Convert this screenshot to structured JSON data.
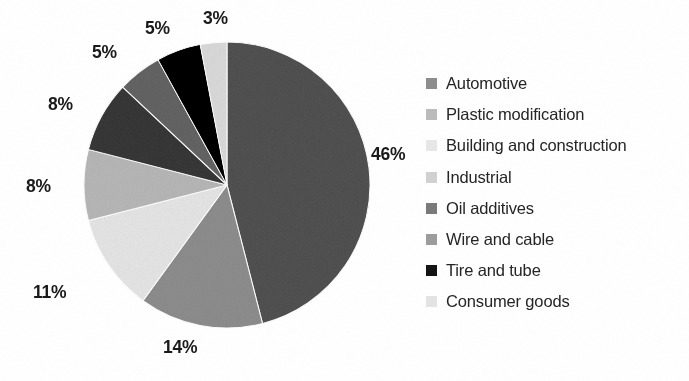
{
  "chart_data": {
    "type": "pie",
    "title": "",
    "subtitle": "",
    "xlabel": "",
    "ylabel": "",
    "grid": false,
    "legend_position": "right",
    "start_angle_deg": 0,
    "direction": "clockwise",
    "units": "percent",
    "total": 100,
    "categories": [
      "Automotive",
      "Plastic modification",
      "Building and construction",
      "Industrial",
      "Oil additives",
      "Wire and cable",
      "Tire and tube",
      "Consumer goods"
    ],
    "values": [
      46,
      14,
      11,
      8,
      8,
      5,
      5,
      3
    ],
    "data_labels": [
      "46%",
      "14%",
      "11%",
      "8%",
      "8%",
      "5%",
      "5%",
      "3%"
    ],
    "slice_colors": [
      "#8e8e8e",
      "#bdbdbd",
      "#f2f2f2",
      "#d8d8d8",
      "#757575",
      "#9e9e9e",
      "#111111",
      "#ececec"
    ],
    "slices": [
      {
        "label": "Automotive",
        "value": 46,
        "data_label": "46%",
        "color": "#8e8e8e"
      },
      {
        "label": "Plastic modification",
        "value": 14,
        "data_label": "14%",
        "color": "#bdbdbd"
      },
      {
        "label": "Building and construction",
        "value": 11,
        "data_label": "11%",
        "color": "#f2f2f2"
      },
      {
        "label": "Industrial",
        "value": 8,
        "data_label": "8%",
        "color": "#d8d8d8"
      },
      {
        "label": "Oil additives",
        "value": 8,
        "data_label": "8%",
        "color": "#757575"
      },
      {
        "label": "Wire and cable",
        "value": 5,
        "data_label": "5%",
        "color": "#9e9e9e"
      },
      {
        "label": "Tire and tube",
        "value": 5,
        "data_label": "5%",
        "color": "#111111"
      },
      {
        "label": "Consumer goods",
        "value": 3,
        "data_label": "3%",
        "color": "#ececec"
      }
    ]
  },
  "geometry": {
    "center_x": 227,
    "center_y": 185,
    "radius": 143,
    "label_positions": [
      {
        "data_label": "46%",
        "x": 371,
        "y": 144
      },
      {
        "data_label": "14%",
        "x": 163,
        "y": 337
      },
      {
        "data_label": "11%",
        "x": 33,
        "y": 282
      },
      {
        "data_label": "8%",
        "x": 26,
        "y": 176
      },
      {
        "data_label": "8%",
        "x": 48,
        "y": 94
      },
      {
        "data_label": "5%",
        "x": 92,
        "y": 42
      },
      {
        "data_label": "5%",
        "x": 145,
        "y": 18
      },
      {
        "data_label": "3%",
        "x": 203,
        "y": 8
      }
    ]
  },
  "legend": {
    "items": [
      {
        "label": "Automotive",
        "swatch_color": "#8e8e8e",
        "swatch_icon": "square-swatch-icon"
      },
      {
        "label": "Plastic modification",
        "swatch_color": "#bcbcbc",
        "swatch_icon": "square-swatch-icon"
      },
      {
        "label": "Building and construction",
        "swatch_color": "#e8e8e8",
        "swatch_icon": "square-swatch-icon"
      },
      {
        "label": "Industrial",
        "swatch_color": "#d2d2d2",
        "swatch_icon": "square-swatch-icon"
      },
      {
        "label": "Oil additives",
        "swatch_color": "#7a7a7a",
        "swatch_icon": "square-swatch-icon"
      },
      {
        "label": "Wire and cable",
        "swatch_color": "#9d9d9d",
        "swatch_icon": "square-swatch-icon"
      },
      {
        "label": "Tire and tube",
        "swatch_color": "#141414",
        "swatch_icon": "square-swatch-icon"
      },
      {
        "label": "Consumer goods",
        "swatch_color": "#e4e4e4",
        "swatch_icon": "square-swatch-icon"
      }
    ]
  },
  "colors": {
    "background": "#ffffff",
    "label_text": "#1a1a1a",
    "legend_text": "#252525"
  }
}
